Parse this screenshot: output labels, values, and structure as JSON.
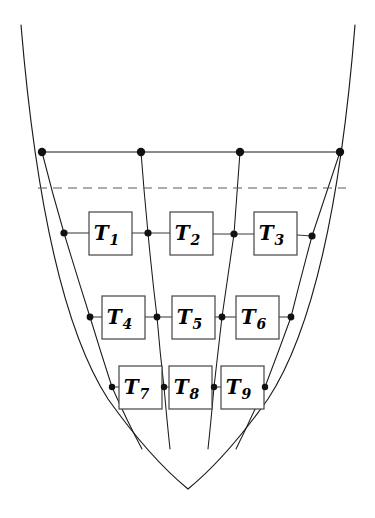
{
  "figure": {
    "background_color": "#ffffff",
    "line_color": "#1a1a1a",
    "dashed_color": "#5a5a5a",
    "box_fill": "#ffffff",
    "box_stroke": "#444444",
    "dot_color": "#111111"
  },
  "elements": {
    "boxes": [
      {
        "id": "T1",
        "base": "T",
        "sub": "1",
        "x": 89,
        "y": 212,
        "w": 43,
        "h": 43
      },
      {
        "id": "T2",
        "base": "T",
        "sub": "2",
        "x": 170,
        "y": 212,
        "w": 43,
        "h": 43
      },
      {
        "id": "T3",
        "base": "T",
        "sub": "3",
        "x": 254,
        "y": 212,
        "w": 43,
        "h": 43
      },
      {
        "id": "T4",
        "base": "T",
        "sub": "4",
        "x": 102,
        "y": 296,
        "w": 43,
        "h": 43
      },
      {
        "id": "T5",
        "base": "T",
        "sub": "5",
        "x": 172,
        "y": 296,
        "w": 43,
        "h": 43
      },
      {
        "id": "T6",
        "base": "T",
        "sub": "6",
        "x": 236,
        "y": 296,
        "w": 43,
        "h": 43
      },
      {
        "id": "T7",
        "base": "T",
        "sub": "7",
        "x": 119,
        "y": 366,
        "w": 43,
        "h": 43
      },
      {
        "id": "T8",
        "base": "T",
        "sub": "8",
        "x": 169,
        "y": 366,
        "w": 43,
        "h": 43
      },
      {
        "id": "T9",
        "base": "T",
        "sub": "9",
        "x": 221,
        "y": 366,
        "w": 43,
        "h": 43
      }
    ],
    "nodes": [
      {
        "name": "top-left",
        "x": 42,
        "y": 152,
        "r": 4.2
      },
      {
        "name": "top-mid-left",
        "x": 141,
        "y": 152,
        "r": 4.2
      },
      {
        "name": "top-mid-right",
        "x": 240,
        "y": 152,
        "r": 4.2
      },
      {
        "name": "top-right",
        "x": 340,
        "y": 152,
        "r": 4.2
      },
      {
        "name": "row1-left",
        "x": 64,
        "y": 233,
        "r": 3.6
      },
      {
        "name": "row1-mid-left",
        "x": 148,
        "y": 233,
        "r": 3.6
      },
      {
        "name": "row1-mid-right",
        "x": 234,
        "y": 234,
        "r": 3.6
      },
      {
        "name": "row1-right",
        "x": 312,
        "y": 236,
        "r": 3.6
      },
      {
        "name": "row2-left",
        "x": 90,
        "y": 317,
        "r": 3.4
      },
      {
        "name": "row2-mid-left",
        "x": 157,
        "y": 317,
        "r": 3.4
      },
      {
        "name": "row2-mid-right",
        "x": 222,
        "y": 317,
        "r": 3.4
      },
      {
        "name": "row2-right",
        "x": 291,
        "y": 317,
        "r": 3.4
      },
      {
        "name": "row3-left",
        "x": 112,
        "y": 387,
        "r": 3.2
      },
      {
        "name": "row3-mid-left",
        "x": 164,
        "y": 387,
        "r": 3.2
      },
      {
        "name": "row3-mid-right",
        "x": 214,
        "y": 387,
        "r": 3.2
      },
      {
        "name": "row3-right",
        "x": 265,
        "y": 387,
        "r": 3.2
      }
    ],
    "top_line": {
      "x1": 42,
      "y1": 152,
      "x2": 340,
      "y2": 152
    },
    "dashed_line": {
      "x1": 38,
      "y1": 188,
      "x2": 346,
      "y2": 188
    },
    "boundary_curve": "M 21 25 Q 44 300 108 399 Q 150 458 188 489 Q 226 458 268 399 Q 333 300 355 25",
    "streamlines": [
      {
        "name": "streamline-left",
        "d": "M 42 152 Q 52 192 64 233 Q 77 276 90 317 Q 101 353 112 387 Q 127 421 142 449"
      },
      {
        "name": "streamline-mid-left",
        "d": "M 141 152 Q 144 192 148 233 Q 152 276 157 317 Q 160 353 164 387 Q 167 421 170 449"
      },
      {
        "name": "streamline-mid-right",
        "d": "M 240 152 Q 237 193 234 234 Q 228 276 222 317 Q 218 353 214 387 Q 211 421 208 449"
      },
      {
        "name": "streamline-right",
        "d": "M 340 152 Q 326 194 312 236 Q 301 277 291 317 Q 278 353 265 387 Q 250 421 236 449"
      }
    ],
    "connectors": [
      {
        "name": "connector-row1-a",
        "x1": 64,
        "y1": 233,
        "x2": 89,
        "y2": 233
      },
      {
        "name": "connector-row1-b",
        "x1": 132,
        "y1": 233,
        "x2": 170,
        "y2": 233
      },
      {
        "name": "connector-row1-c",
        "x1": 213,
        "y1": 234,
        "x2": 254,
        "y2": 234
      },
      {
        "name": "connector-row1-d",
        "x1": 297,
        "y1": 235,
        "x2": 312,
        "y2": 236
      },
      {
        "name": "connector-row2-a",
        "x1": 90,
        "y1": 317,
        "x2": 102,
        "y2": 317
      },
      {
        "name": "connector-row2-b",
        "x1": 145,
        "y1": 317,
        "x2": 172,
        "y2": 317
      },
      {
        "name": "connector-row2-c",
        "x1": 215,
        "y1": 317,
        "x2": 236,
        "y2": 317
      },
      {
        "name": "connector-row2-d",
        "x1": 279,
        "y1": 317,
        "x2": 291,
        "y2": 317
      },
      {
        "name": "connector-row3-a",
        "x1": 112,
        "y1": 387,
        "x2": 119,
        "y2": 387
      },
      {
        "name": "connector-row3-b",
        "x1": 162,
        "y1": 387,
        "x2": 169,
        "y2": 387
      },
      {
        "name": "connector-row3-c",
        "x1": 212,
        "y1": 387,
        "x2": 221,
        "y2": 387
      },
      {
        "name": "connector-row3-d",
        "x1": 264,
        "y1": 387,
        "x2": 265,
        "y2": 387
      }
    ]
  }
}
